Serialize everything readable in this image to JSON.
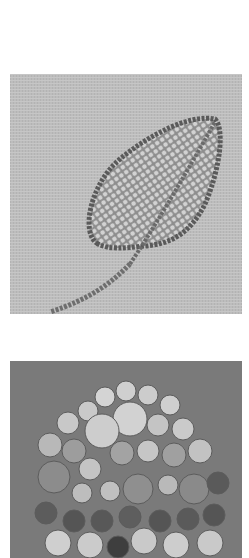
{
  "page": {
    "background": "#ffffff"
  },
  "photos": [
    {
      "subject": "beaded leaf embroidery on linen",
      "background_color": "#bdbdbd",
      "bead_color": "#8a8a8a",
      "highlight_color": "#d6d6d6"
    },
    {
      "subject": "cluster of flower-shaped glass beads",
      "background_color": "#7a7a7a",
      "light_bead_color": "#cfcfcf",
      "dark_bead_color": "#3e3e3e"
    }
  ]
}
